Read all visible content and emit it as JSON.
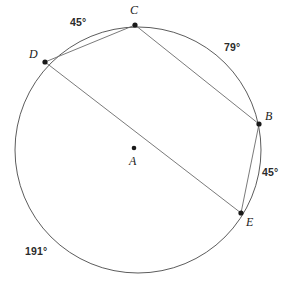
{
  "figure": {
    "type": "circle-geometry-diagram",
    "background_color": "#ffffff",
    "stroke_color": "#4a4a4a",
    "label_color": "#1a1a1a",
    "circle": {
      "center_label": "A",
      "center_x": 138,
      "center_y": 150,
      "radius": 123
    },
    "points": [
      {
        "label": "A",
        "role": "center",
        "x": 134,
        "y": 148,
        "label_x": 129,
        "label_y": 155
      },
      {
        "label": "B",
        "role": "on-circle",
        "x": 259,
        "y": 124,
        "label_x": 265,
        "label_y": 110
      },
      {
        "label": "C",
        "role": "on-circle",
        "x": 135,
        "y": 25,
        "label_x": 130,
        "label_y": 4
      },
      {
        "label": "D",
        "role": "on-circle",
        "x": 45,
        "y": 62,
        "label_x": 29,
        "label_y": 48
      },
      {
        "label": "E",
        "role": "on-circle",
        "x": 241,
        "y": 213,
        "label_x": 246,
        "label_y": 216
      }
    ],
    "chords": [
      {
        "name": "chord-DC",
        "from": "D",
        "to": "C"
      },
      {
        "name": "chord-CB",
        "from": "C",
        "to": "B"
      },
      {
        "name": "chord-BE",
        "from": "B",
        "to": "E"
      },
      {
        "name": "chord-DE",
        "from": "D",
        "to": "E"
      }
    ],
    "arc_labels": [
      {
        "name": "arc-DC-measure",
        "text": "45°",
        "x": 70,
        "y": 17,
        "arc": "DC"
      },
      {
        "name": "arc-CB-measure",
        "text": "79°",
        "x": 224,
        "y": 42,
        "arc": "CB"
      },
      {
        "name": "arc-BE-measure",
        "text": "45°",
        "x": 262,
        "y": 167,
        "arc": "BE"
      },
      {
        "name": "arc-ED-measure",
        "text": "191°",
        "x": 25,
        "y": 246,
        "arc": "ED"
      }
    ]
  }
}
